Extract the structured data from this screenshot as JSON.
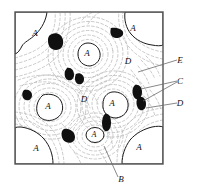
{
  "figure": {
    "type": "micrograph-schematic",
    "frame": {
      "x": 15,
      "y": 12,
      "width": 148,
      "height": 152,
      "stroke": "#555555"
    },
    "colors": {
      "frame": "#555555",
      "contour": "#b9b9b9",
      "grain_outline": "#1a1a1a",
      "precipitate": "#101010",
      "label": "#111111",
      "leader": "#6b6b6b",
      "background": "#ffffff"
    }
  },
  "region_labels": [
    {
      "id": "a-top-left",
      "text": "A",
      "x": 35,
      "y": 36
    },
    {
      "id": "a-top-right",
      "text": "A",
      "x": 133,
      "y": 31
    },
    {
      "id": "a-upper-middle",
      "text": "A",
      "x": 87,
      "y": 56
    },
    {
      "id": "a-mid-left",
      "text": "A",
      "x": 48,
      "y": 109
    },
    {
      "id": "a-mid-right",
      "text": "A",
      "x": 112,
      "y": 106
    },
    {
      "id": "a-bottom-center",
      "text": "A",
      "x": 94,
      "y": 136
    },
    {
      "id": "a-bottom-left",
      "text": "A",
      "x": 36,
      "y": 151
    },
    {
      "id": "a-bottom-right",
      "text": "A",
      "x": 139,
      "y": 150
    },
    {
      "id": "d-center",
      "text": "D",
      "x": 84,
      "y": 102
    },
    {
      "id": "d-upper-right",
      "text": "D",
      "x": 128,
      "y": 64
    }
  ],
  "callouts": [
    {
      "id": "callout-e",
      "text": "E",
      "label_x": 180,
      "label_y": 63,
      "leaders": [
        {
          "x1": 177,
          "y1": 60,
          "x2": 138,
          "y2": 72
        }
      ]
    },
    {
      "id": "callout-c",
      "text": "C",
      "label_x": 180,
      "label_y": 84,
      "leaders": [
        {
          "x1": 177,
          "y1": 81,
          "x2": 141,
          "y2": 89
        },
        {
          "x1": 177,
          "y1": 82,
          "x2": 143,
          "y2": 101
        }
      ]
    },
    {
      "id": "callout-d",
      "text": "D",
      "label_x": 180,
      "label_y": 106,
      "leaders": [
        {
          "x1": 177,
          "y1": 103,
          "x2": 146,
          "y2": 108
        }
      ]
    },
    {
      "id": "callout-b",
      "text": "B",
      "label_x": 121,
      "label_y": 182,
      "leaders": [
        {
          "x1": 118,
          "y1": 177,
          "x2": 104,
          "y2": 146
        }
      ]
    }
  ],
  "precipitates": [
    {
      "id": "precipitate-1",
      "cx": 57,
      "cy": 41
    },
    {
      "id": "precipitate-2",
      "cx": 117,
      "cy": 32
    },
    {
      "id": "precipitate-3",
      "cx": 70,
      "cy": 74
    },
    {
      "id": "precipitate-4",
      "cx": 79,
      "cy": 78
    },
    {
      "id": "precipitate-5",
      "cx": 27,
      "cy": 95
    },
    {
      "id": "precipitate-6",
      "cx": 137,
      "cy": 92
    },
    {
      "id": "precipitate-7",
      "cx": 141,
      "cy": 103
    },
    {
      "id": "precipitate-8",
      "cx": 107,
      "cy": 122
    },
    {
      "id": "precipitate-9",
      "cx": 69,
      "cy": 135
    }
  ]
}
